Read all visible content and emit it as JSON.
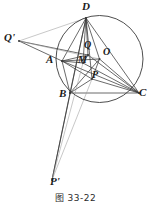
{
  "figure": {
    "caption": "图 33-22",
    "stroke_color": "#3a3a3a",
    "faint_color": "#9a9a9a",
    "label_color": "#1a1a1a",
    "background": "#ffffff",
    "circle": {
      "cx": 99.5,
      "cy": 59,
      "r": 43.5,
      "label": "circumcircle"
    },
    "points": [
      {
        "id": "D",
        "label": "D",
        "x": 86,
        "y": 18,
        "lx": 82,
        "ly": 1,
        "size": 11
      },
      {
        "id": "Q",
        "label": "Q",
        "x": 88,
        "y": 55,
        "lx": 84,
        "ly": 40,
        "size": 10
      },
      {
        "id": "O",
        "label": "O",
        "x": 99.5,
        "y": 59,
        "lx": 103,
        "ly": 47,
        "size": 10
      },
      {
        "id": "A",
        "label": "A",
        "x": 62,
        "y": 61,
        "lx": 46,
        "ly": 54,
        "size": 11
      },
      {
        "id": "M",
        "label": "M",
        "x": 83,
        "y": 63,
        "lx": 78,
        "ly": 55,
        "size": 10
      },
      {
        "id": "P",
        "label": "P",
        "x": 92,
        "y": 79,
        "lx": 92,
        "ly": 70,
        "size": 10
      },
      {
        "id": "B",
        "label": "B",
        "x": 70,
        "y": 93,
        "lx": 59,
        "ly": 88,
        "size": 11
      },
      {
        "id": "C",
        "label": "C",
        "x": 139,
        "y": 93,
        "lx": 139,
        "ly": 87,
        "size": 11
      },
      {
        "id": "Qp",
        "label": "Q'",
        "x": 19,
        "y": 41,
        "lx": 4,
        "ly": 32,
        "size": 11
      },
      {
        "id": "Pp",
        "label": "P'",
        "x": 52,
        "y": 180,
        "lx": 50,
        "ly": 176,
        "size": 11
      }
    ],
    "segments": [
      {
        "name": "D-A",
        "x1": 86,
        "y1": 18,
        "x2": 62,
        "y2": 61,
        "weight": "normal"
      },
      {
        "name": "D-B",
        "x1": 86,
        "y1": 18,
        "x2": 70,
        "y2": 93,
        "weight": "normal"
      },
      {
        "name": "D-C",
        "x1": 86,
        "y1": 18,
        "x2": 139,
        "y2": 93,
        "weight": "normal"
      },
      {
        "name": "D-M",
        "x1": 86,
        "y1": 18,
        "x2": 83,
        "y2": 63,
        "weight": "normal"
      },
      {
        "name": "D-Q",
        "x1": 86,
        "y1": 18,
        "x2": 88,
        "y2": 55,
        "weight": "normal"
      },
      {
        "name": "D-P",
        "x1": 86,
        "y1": 18,
        "x2": 92,
        "y2": 79,
        "weight": "normal"
      },
      {
        "name": "D-O",
        "x1": 86,
        "y1": 18,
        "x2": 99.5,
        "y2": 59,
        "weight": "normal"
      },
      {
        "name": "A-B",
        "x1": 62,
        "y1": 61,
        "x2": 70,
        "y2": 93,
        "weight": "normal"
      },
      {
        "name": "A-C",
        "x1": 62,
        "y1": 61,
        "x2": 139,
        "y2": 93,
        "weight": "normal"
      },
      {
        "name": "A-Q",
        "x1": 62,
        "y1": 61,
        "x2": 88,
        "y2": 55,
        "weight": "normal"
      },
      {
        "name": "A-M",
        "x1": 62,
        "y1": 61,
        "x2": 83,
        "y2": 63,
        "weight": "normal"
      },
      {
        "name": "A-P",
        "x1": 62,
        "y1": 61,
        "x2": 92,
        "y2": 79,
        "weight": "normal"
      },
      {
        "name": "A-O",
        "x1": 62,
        "y1": 61,
        "x2": 99.5,
        "y2": 59,
        "weight": "normal"
      },
      {
        "name": "B-C",
        "x1": 70,
        "y1": 93,
        "x2": 139,
        "y2": 93,
        "weight": "normal"
      },
      {
        "name": "B-P",
        "x1": 70,
        "y1": 93,
        "x2": 92,
        "y2": 79,
        "weight": "normal"
      },
      {
        "name": "B-O",
        "x1": 70,
        "y1": 93,
        "x2": 99.5,
        "y2": 59,
        "weight": "normal"
      },
      {
        "name": "C-P",
        "x1": 139,
        "y1": 93,
        "x2": 92,
        "y2": 79,
        "weight": "normal"
      },
      {
        "name": "C-O",
        "x1": 139,
        "y1": 93,
        "x2": 99.5,
        "y2": 59,
        "weight": "normal"
      },
      {
        "name": "C-Q",
        "x1": 139,
        "y1": 93,
        "x2": 88,
        "y2": 55,
        "weight": "normal"
      },
      {
        "name": "C-M",
        "x1": 139,
        "y1": 93,
        "x2": 83,
        "y2": 63,
        "weight": "normal"
      },
      {
        "name": "O-P",
        "x1": 99.5,
        "y1": 59,
        "x2": 92,
        "y2": 79,
        "weight": "normal"
      },
      {
        "name": "Q-M",
        "x1": 88,
        "y1": 55,
        "x2": 83,
        "y2": 63,
        "weight": "normal"
      },
      {
        "name": "Qp-A",
        "x1": 19,
        "y1": 41,
        "x2": 62,
        "y2": 61,
        "weight": "normal"
      },
      {
        "name": "Qp-D",
        "x1": 19,
        "y1": 41,
        "x2": 86,
        "y2": 18,
        "weight": "faint"
      },
      {
        "name": "Qp-Q",
        "x1": 19,
        "y1": 41,
        "x2": 88,
        "y2": 55,
        "weight": "normal"
      },
      {
        "name": "Qp-O",
        "x1": 19,
        "y1": 41,
        "x2": 99.5,
        "y2": 59,
        "weight": "faint"
      },
      {
        "name": "Pp-B",
        "x1": 52,
        "y1": 180,
        "x2": 70,
        "y2": 93,
        "weight": "normal"
      },
      {
        "name": "Pp-D",
        "x1": 52,
        "y1": 180,
        "x2": 86,
        "y2": 18,
        "weight": "normal"
      },
      {
        "name": "Pp-P",
        "x1": 52,
        "y1": 180,
        "x2": 92,
        "y2": 79,
        "weight": "faint"
      },
      {
        "name": "Pp-M",
        "x1": 52,
        "y1": 180,
        "x2": 83,
        "y2": 63,
        "weight": "faint"
      }
    ]
  }
}
